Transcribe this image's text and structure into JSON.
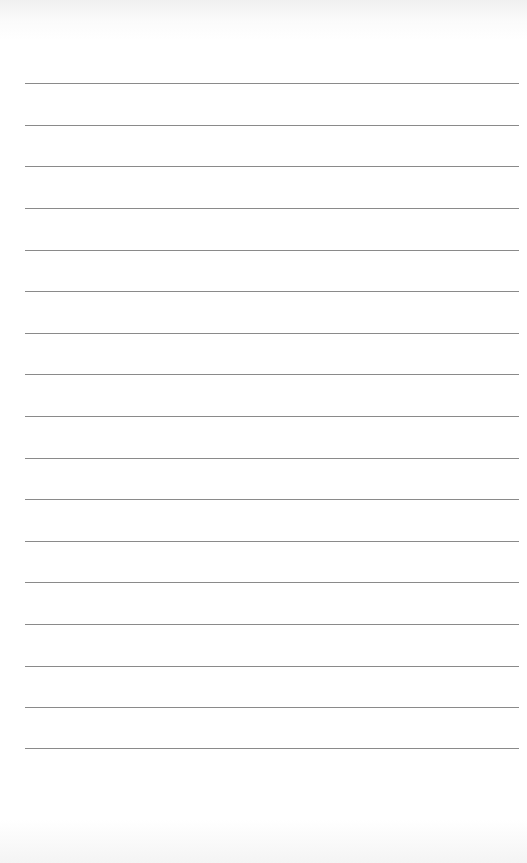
{
  "page": {
    "type": "lined-paper",
    "background_color": "#ffffff",
    "rule_color": "#8a8a8a",
    "rule_count": 17,
    "rules_y": [
      83,
      125,
      166,
      208,
      250,
      291,
      333,
      374,
      416,
      458,
      499,
      541,
      582,
      624,
      666,
      707,
      748
    ]
  }
}
